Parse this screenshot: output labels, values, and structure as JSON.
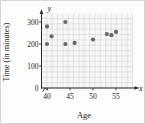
{
  "figure": {
    "x_axis_letter": "x",
    "y_axis_letter": "y",
    "x_axis_title": "Age",
    "y_axis_title": "Time (in minutes)"
  },
  "chart_data": {
    "type": "scatter",
    "title": "",
    "xlabel": "Age",
    "ylabel": "Time (in minutes)",
    "x_ticks": [
      40,
      45,
      50,
      55
    ],
    "y_ticks": [
      0,
      100,
      200,
      300
    ],
    "xlim": [
      40,
      59
    ],
    "ylim": [
      0,
      338
    ],
    "grid": true,
    "legend": false,
    "points": [
      [
        40,
        280
      ],
      [
        40,
        200
      ],
      [
        41,
        235
      ],
      [
        44,
        300
      ],
      [
        44,
        200
      ],
      [
        46,
        205
      ],
      [
        50,
        220
      ],
      [
        53,
        245
      ],
      [
        54,
        240
      ],
      [
        55,
        255
      ]
    ],
    "point_color": "#686868",
    "axis_color": "#2b2b2b",
    "grid_line_color": "#d9d9d9",
    "grid_bg_color": "#f7f7f7",
    "label_color": "#1c1c1c"
  }
}
